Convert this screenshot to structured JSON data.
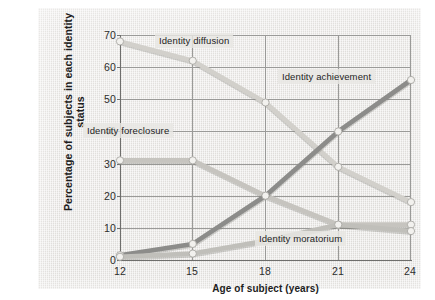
{
  "chart_data": {
    "type": "line",
    "title": "",
    "xlabel": "Age of subject (years)",
    "ylabel": "Percentage of subjects in each identity status",
    "x": [
      12,
      15,
      18,
      21,
      24
    ],
    "xticklabels": [
      "12",
      "15",
      "18",
      "21",
      "24"
    ],
    "yticklabels": [
      "0",
      "10",
      "20",
      "30",
      "40",
      "50",
      "60",
      "70"
    ],
    "yticks": [
      0,
      10,
      20,
      30,
      40,
      50,
      60,
      70
    ],
    "xlim": [
      12,
      24
    ],
    "ylim": [
      0,
      70
    ],
    "grid": true,
    "legend": "inline-annotations",
    "series": [
      {
        "name": "Identity diffusion",
        "values": [
          68,
          62,
          49,
          29,
          18
        ],
        "color": "#d2d0cb"
      },
      {
        "name": "Identity foreclosure",
        "values": [
          31,
          31,
          20,
          11,
          11
        ],
        "color": "#c6c4bf"
      },
      {
        "name": "Identity achievement",
        "values": [
          1.5,
          5,
          20,
          40,
          56
        ],
        "color": "#8c8c8a"
      },
      {
        "name": "Identity moratorium",
        "values": [
          1,
          2,
          6,
          11,
          9
        ],
        "color": "#c0bfba"
      }
    ],
    "annotations": [
      {
        "text": "Identity diffusion",
        "x": 16.3,
        "y": 63.5
      },
      {
        "text": "Identity achievement",
        "x": 20.2,
        "y": 53.5
      },
      {
        "text": "Identity foreclosure",
        "x": 12.25,
        "y": 34.5
      },
      {
        "text": "Identity moratorium",
        "x": 20.5,
        "y": 3.6
      }
    ]
  },
  "colors": {
    "panel_background": "#e7e5e2",
    "grid": "#9a9a98",
    "axis": "#6e6e6c",
    "text": "#1d1d1d",
    "marker_fill": "#f2f1ee",
    "marker_stroke": "#a9a8a4"
  }
}
